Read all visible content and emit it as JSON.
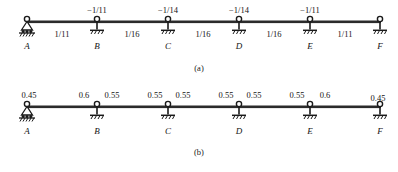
{
  "figure": {
    "type": "structural-beam-diagram",
    "geometry": {
      "support_x": [
        27,
        97,
        168,
        239,
        310,
        380
      ],
      "span_mid_x": [
        62,
        132,
        203,
        274,
        345
      ]
    },
    "node_labels": [
      "A",
      "B",
      "C",
      "D",
      "E",
      "F"
    ],
    "support_types": [
      "pin",
      "roller",
      "roller",
      "roller",
      "roller",
      "roller"
    ]
  },
  "panel_a": {
    "caption": "(a)",
    "caption_x": 199,
    "top_values": [
      {
        "text": "−1/11",
        "x": 97
      },
      {
        "text": "−1/14",
        "x": 168
      },
      {
        "text": "−1/14",
        "x": 239
      },
      {
        "text": "−1/11",
        "x": 310
      }
    ],
    "span_values": [
      {
        "text": "1/11",
        "x": 62
      },
      {
        "text": "1/16",
        "x": 132
      },
      {
        "text": "1/16",
        "x": 203
      },
      {
        "text": "1/16",
        "x": 274
      },
      {
        "text": "1/11",
        "x": 345
      }
    ]
  },
  "panel_b": {
    "caption": "(b)",
    "caption_x": 199,
    "top_values": [
      {
        "text": "0.45",
        "x": 29
      },
      {
        "text": "0.6",
        "x": 84
      },
      {
        "text": "0.55",
        "x": 112
      },
      {
        "text": "0.55",
        "x": 155
      },
      {
        "text": "0.55",
        "x": 183
      },
      {
        "text": "0.55",
        "x": 226
      },
      {
        "text": "0.55",
        "x": 254
      },
      {
        "text": "0.55",
        "x": 297
      },
      {
        "text": "0.6",
        "x": 325
      },
      {
        "text": "0.45",
        "x": 378
      }
    ]
  },
  "colors": {
    "beam": "#2b2b2b",
    "text": "#141414",
    "background": "#ffffff"
  }
}
